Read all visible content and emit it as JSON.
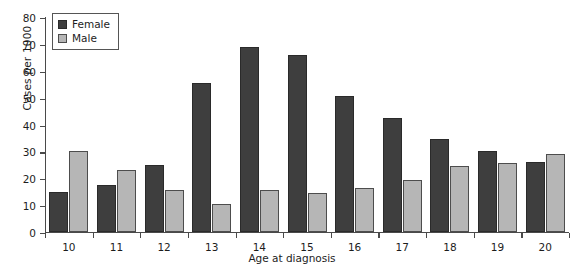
{
  "chart_data": {
    "type": "bar",
    "title": "",
    "xlabel": "Age at diagnosis",
    "ylabel": "Cases per 1000",
    "categories": [
      "10",
      "11",
      "12",
      "13",
      "14",
      "15",
      "16",
      "17",
      "18",
      "19",
      "20"
    ],
    "series": [
      {
        "name": "Female",
        "color": "#3e3e3e",
        "values": [
          15,
          17.5,
          25,
          55.5,
          69,
          66,
          50.5,
          42.5,
          34.5,
          30,
          26
        ]
      },
      {
        "name": "Male",
        "color": "#b6b6b6",
        "values": [
          30,
          23,
          15.5,
          10.5,
          15.5,
          14.5,
          16.5,
          19.5,
          24.5,
          25.5,
          29
        ]
      }
    ],
    "ylim": [
      0,
      80
    ],
    "yticks": [
      0,
      10,
      20,
      30,
      40,
      50,
      60,
      70,
      80
    ],
    "ytick_labels": [
      "0",
      "10",
      "20",
      "30",
      "40",
      "50",
      "60",
      "70",
      "80"
    ],
    "grid": false,
    "legend_position": "top-left",
    "legend_entries": [
      "Female",
      "Male"
    ]
  }
}
